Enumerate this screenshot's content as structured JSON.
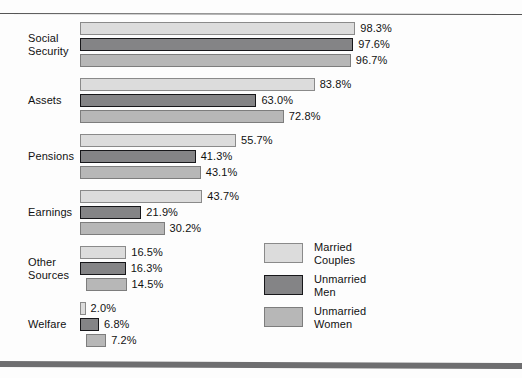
{
  "chart_data": {
    "type": "bar",
    "orientation": "horizontal",
    "title": "",
    "subtitle": "",
    "xlabel": "",
    "ylabel": "",
    "grid": false,
    "value_suffix": "%",
    "xlim": [
      0,
      98.3
    ],
    "legend_position": "inside-right-lower",
    "categories": [
      "Social\nSecurity",
      "Assets",
      "Pensions",
      "Earnings",
      "Other\nSources",
      "Welfare"
    ],
    "series": [
      {
        "name": "Married\nCouples",
        "color": "#dcdcdc",
        "values": [
          98.3,
          83.8,
          55.7,
          43.7,
          16.5,
          2.0
        ],
        "labels": [
          "98.3%",
          "83.8%",
          "55.7%",
          "43.7%",
          "16.5%",
          "2.0%"
        ]
      },
      {
        "name": "Unmarried\nMen",
        "color": "#848486",
        "values": [
          97.6,
          63.0,
          41.3,
          21.9,
          16.3,
          6.8
        ],
        "labels": [
          "97.6%",
          "63.0%",
          "41.3%",
          "21.9%",
          "16.3%",
          "6.8%"
        ]
      },
      {
        "name": "Unmarried\nWomen",
        "color": "#b7b7b7",
        "values": [
          96.7,
          72.8,
          43.1,
          30.2,
          14.5,
          7.2
        ],
        "labels": [
          "96.7%",
          "72.8%",
          "43.1%",
          "30.2%",
          "14.5%",
          "7.2%"
        ]
      }
    ]
  },
  "labels": {
    "categories": {
      "social_security": "Social\nSecurity",
      "assets": "Assets",
      "pensions": "Pensions",
      "earnings": "Earnings",
      "other_sources": "Other\nSources",
      "welfare": "Welfare"
    },
    "values": {
      "social_security": [
        "98.3%",
        "97.6%",
        "96.7%"
      ],
      "assets": [
        "83.8%",
        "63.0%",
        "72.8%"
      ],
      "pensions": [
        "55.7%",
        "41.3%",
        "43.1%"
      ],
      "earnings": [
        "43.7%",
        "21.9%",
        "30.2%"
      ],
      "other_sources": [
        "16.5%",
        "16.3%",
        "14.5%"
      ],
      "welfare": [
        "2.0%",
        "6.8%",
        "7.2%"
      ]
    },
    "legend": [
      "Married\nCouples",
      "Unmarried\nMen",
      "Unmarried\nWomen"
    ]
  },
  "colors": {
    "series_married_couples": "#dcdcdc",
    "series_unmarried_men": "#848486",
    "series_unmarried_women": "#b7b7b7",
    "rule_top": "#555555",
    "rule_bottom": "#6e6e70",
    "text": "#111111",
    "background": "#fdfdfd"
  }
}
